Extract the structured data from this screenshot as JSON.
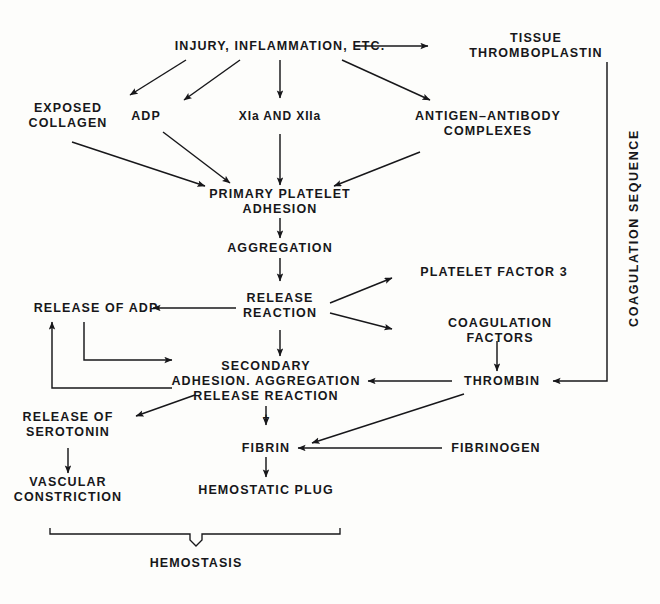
{
  "figure": {
    "ink_color": "#17171a",
    "background_color": "#fdfdfb"
  },
  "nodes": {
    "injury": "INJURY, INFLAMMATION, ETC.",
    "tissue_thromboplastin": "TISSUE THROMBOPLASTIN",
    "exposed_collagen": "EXPOSED\nCOLLAGEN",
    "adp": "ADP",
    "factors_xi_xii": "XIa AND XIIa",
    "antigen_antibody": "ANTIGEN–ANTIBODY\nCOMPLEXES",
    "primary_platelet_adhesion": "PRIMARY PLATELET\nADHESION",
    "aggregation": "AGGREGATION",
    "release_reaction": "RELEASE\nREACTION",
    "platelet_factor_3": "PLATELET FACTOR 3",
    "coagulation_factors": "COAGULATION FACTORS",
    "release_of_adp": "RELEASE OF ADP",
    "secondary": "SECONDARY\nADHESION. AGGREGATION\nRELEASE REACTION",
    "thrombin": "THROMBIN",
    "release_of_serotonin": "RELEASE OF\nSEROTONIN",
    "fibrin": "FIBRIN",
    "fibrinogen": "FIBRINOGEN",
    "hemostatic_plug": "HEMOSTATIC PLUG",
    "vascular_constriction": "VASCULAR\nCONSTRICTION",
    "hemostasis": "HEMOSTASIS",
    "plus_sign": "+"
  },
  "labels": {
    "coagulation_sequence": "COAGULATION SEQUENCE"
  },
  "edges": [
    {
      "from": "injury",
      "to": "tissue_thromboplastin",
      "kind": "arrow-right"
    },
    {
      "from": "injury",
      "to": "exposed_collagen",
      "kind": "arrow-diagonal"
    },
    {
      "from": "injury",
      "to": "adp",
      "kind": "arrow-diagonal"
    },
    {
      "from": "injury",
      "to": "factors_xi_xii",
      "kind": "arrow-down"
    },
    {
      "from": "injury",
      "to": "antigen_antibody",
      "kind": "arrow-diagonal"
    },
    {
      "from": "exposed_collagen",
      "to": "primary_platelet_adhesion",
      "kind": "arrow-diagonal"
    },
    {
      "from": "adp",
      "to": "primary_platelet_adhesion",
      "kind": "arrow-diagonal"
    },
    {
      "from": "factors_xi_xii",
      "to": "primary_platelet_adhesion",
      "kind": "arrow-down"
    },
    {
      "from": "antigen_antibody",
      "to": "primary_platelet_adhesion",
      "kind": "arrow-diagonal"
    },
    {
      "from": "primary_platelet_adhesion",
      "to": "aggregation",
      "kind": "arrow-down"
    },
    {
      "from": "aggregation",
      "to": "release_reaction",
      "kind": "arrow-down"
    },
    {
      "from": "release_reaction",
      "to": "platelet_factor_3",
      "kind": "arrow-diagonal"
    },
    {
      "from": "release_reaction",
      "to": "coagulation_factors",
      "kind": "arrow-diagonal"
    },
    {
      "from": "release_reaction",
      "to": "release_of_adp",
      "kind": "arrow-left"
    },
    {
      "from": "release_reaction",
      "to": "secondary",
      "kind": "arrow-down"
    },
    {
      "from": "coagulation_factors",
      "to": "thrombin",
      "kind": "arrow-down"
    },
    {
      "from": "tissue_thromboplastin",
      "to": "thrombin",
      "kind": "coagulation-sequence-path"
    },
    {
      "from": "thrombin",
      "to": "secondary",
      "kind": "arrow-left"
    },
    {
      "from": "thrombin",
      "to": "fibrin",
      "kind": "arrow-diagonal"
    },
    {
      "from": "fibrinogen",
      "to": "fibrin",
      "kind": "arrow-left"
    },
    {
      "from": "secondary",
      "to": "fibrin",
      "kind": "arrow-down"
    },
    {
      "from": "secondary",
      "to": "release_of_serotonin",
      "kind": "arrow-diagonal"
    },
    {
      "from": "secondary",
      "to": "release_of_adp",
      "kind": "feedback-loop"
    },
    {
      "from": "release_of_adp",
      "to": "secondary",
      "kind": "feedback-loop"
    },
    {
      "from": "fibrin",
      "to": "hemostatic_plug",
      "kind": "arrow-down"
    },
    {
      "from": "release_of_serotonin",
      "to": "vascular_constriction",
      "kind": "arrow-down"
    }
  ],
  "brace": {
    "label": "HEMOSTASIS",
    "spans": [
      "vascular_constriction",
      "hemostatic_plug"
    ]
  }
}
